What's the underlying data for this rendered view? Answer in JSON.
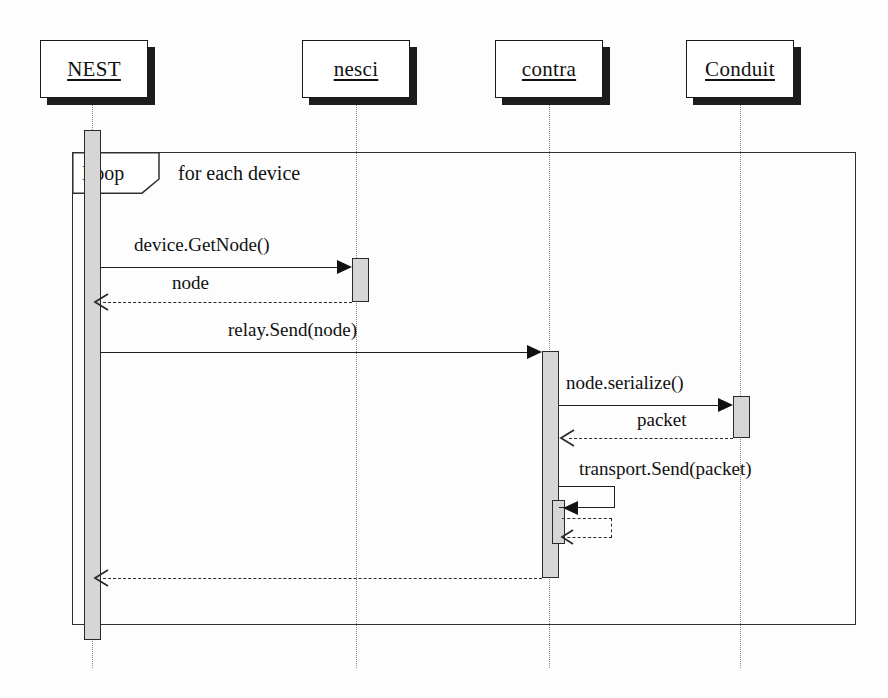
{
  "diagram": {
    "type": "uml-sequence-diagram",
    "title": "",
    "background": "#fdfdfd",
    "line_color": "#1f1f1f",
    "activation_fill": "#d6d6d6",
    "lifeline_color": "#8c8c8c"
  },
  "actors": [
    {
      "id": "nest",
      "label": "NEST",
      "x": 40,
      "y": 40,
      "w": 108,
      "h": 58
    },
    {
      "id": "nesci",
      "label": "nesci",
      "x": 302,
      "y": 40,
      "w": 108,
      "h": 58
    },
    {
      "id": "contra",
      "label": "contra",
      "x": 495,
      "y": 40,
      "w": 108,
      "h": 58
    },
    {
      "id": "conduit",
      "label": "Conduit",
      "x": 686,
      "y": 40,
      "w": 108,
      "h": 58
    }
  ],
  "lifelines": [
    {
      "actor": "nest",
      "x": 92,
      "top": 98,
      "bottom": 668
    },
    {
      "actor": "nesci",
      "x": 356,
      "top": 98,
      "bottom": 668
    },
    {
      "actor": "contra",
      "x": 549,
      "top": 98,
      "bottom": 668
    },
    {
      "actor": "conduit",
      "x": 740,
      "top": 98,
      "bottom": 668
    }
  ],
  "fragment": {
    "kind": "loop",
    "tab_label": "Loop",
    "guard": "for each device",
    "x": 72,
    "y": 152,
    "w": 784,
    "h": 473,
    "tab_w": 86,
    "tab_h": 40
  },
  "activations": [
    {
      "id": "act-nest",
      "actor": "nest",
      "x": 84,
      "y": 130,
      "w": 17,
      "h": 510
    },
    {
      "id": "act-nesci",
      "actor": "nesci",
      "x": 352,
      "y": 258,
      "w": 17,
      "h": 44
    },
    {
      "id": "act-contra",
      "actor": "contra",
      "x": 542,
      "y": 351,
      "w": 17,
      "h": 227
    },
    {
      "id": "act-conduit",
      "actor": "conduit",
      "x": 733,
      "y": 396,
      "w": 17,
      "h": 42
    },
    {
      "id": "act-contra-nested",
      "actor": "contra",
      "x": 552,
      "y": 500,
      "w": 13,
      "h": 44
    }
  ],
  "messages": [
    {
      "id": "m1",
      "label": "device.GetNode()",
      "from": "nest",
      "to": "nesci",
      "style": "solid",
      "arrow": "filled",
      "direction": "right",
      "y": 267,
      "x_start": 101,
      "x_end": 352,
      "label_x": 134,
      "label_y": 234
    },
    {
      "id": "m2",
      "label": "node",
      "from": "nesci",
      "to": "nest",
      "style": "dashed",
      "arrow": "open",
      "direction": "left",
      "y": 302,
      "x_start": 352,
      "x_end": 96,
      "label_x": 172,
      "label_y": 272
    },
    {
      "id": "m3",
      "label": "relay.Send(node)",
      "from": "nest",
      "to": "contra",
      "style": "solid",
      "arrow": "filled",
      "direction": "right",
      "y": 352,
      "x_start": 101,
      "x_end": 542,
      "label_x": 228,
      "label_y": 319
    },
    {
      "id": "m4",
      "label": "node.serialize()",
      "from": "contra",
      "to": "conduit",
      "style": "solid",
      "arrow": "filled",
      "direction": "right",
      "y": 405,
      "x_start": 559,
      "x_end": 733,
      "label_x": 566,
      "label_y": 372
    },
    {
      "id": "m5",
      "label": "packet",
      "from": "conduit",
      "to": "contra",
      "style": "dashed",
      "arrow": "open",
      "direction": "left",
      "y": 438,
      "x_start": 733,
      "x_end": 562,
      "label_x": 637,
      "label_y": 409
    },
    {
      "id": "m6",
      "label": "transport.Send(packet)",
      "from": "contra",
      "to": "contra",
      "style": "self",
      "arrow": "filled",
      "direction": "left",
      "y": 492,
      "label_x": 579,
      "label_y": 458,
      "box_x": 559,
      "box_w": 56,
      "box_h": 22
    },
    {
      "id": "m7",
      "label": "",
      "from": "contra",
      "to": "contra",
      "style": "self-dashed",
      "arrow": "open",
      "direction": "left",
      "y": 538,
      "box_x": 562,
      "box_w": 50,
      "box_h": 20
    },
    {
      "id": "m8",
      "label": "",
      "from": "contra",
      "to": "nest",
      "style": "dashed",
      "arrow": "open",
      "direction": "left",
      "y": 578,
      "x_start": 542,
      "x_end": 96,
      "label_x": 0,
      "label_y": 0
    }
  ]
}
